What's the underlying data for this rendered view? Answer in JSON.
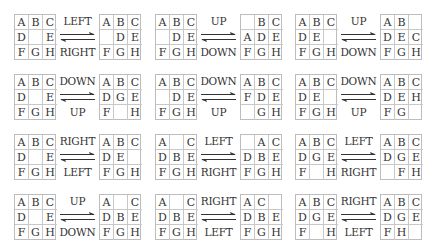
{
  "colors": {
    "text": "#333333",
    "grid_border": "#bdbdbd",
    "arrow": "#333333",
    "background": "#ffffff"
  },
  "transitions": [
    {
      "forward": "LEFT",
      "backward": "RIGHT",
      "from": [
        [
          "A",
          "B",
          "C"
        ],
        [
          "D",
          "",
          "E"
        ],
        [
          "F",
          "G",
          "H"
        ]
      ],
      "to": [
        [
          "A",
          "B",
          "C"
        ],
        [
          "",
          "D",
          "E"
        ],
        [
          "F",
          "G",
          "H"
        ]
      ]
    },
    {
      "forward": "UP",
      "backward": "DOWN",
      "from": [
        [
          "A",
          "B",
          "C"
        ],
        [
          "",
          "D",
          "E"
        ],
        [
          "F",
          "G",
          "H"
        ]
      ],
      "to": [
        [
          "",
          "B",
          "C"
        ],
        [
          "A",
          "D",
          "E"
        ],
        [
          "F",
          "G",
          "H"
        ]
      ]
    },
    {
      "forward": "UP",
      "backward": "DOWN",
      "from": [
        [
          "A",
          "B",
          "C"
        ],
        [
          "D",
          "E",
          ""
        ],
        [
          "F",
          "G",
          "H"
        ]
      ],
      "to": [
        [
          "A",
          "B",
          ""
        ],
        [
          "D",
          "E",
          "C"
        ],
        [
          "F",
          "G",
          "H"
        ]
      ]
    },
    {
      "forward": "DOWN",
      "backward": "UP",
      "from": [
        [
          "A",
          "B",
          "C"
        ],
        [
          "D",
          "",
          "E"
        ],
        [
          "F",
          "G",
          "H"
        ]
      ],
      "to": [
        [
          "A",
          "B",
          "C"
        ],
        [
          "D",
          "G",
          "E"
        ],
        [
          "F",
          "",
          "H"
        ]
      ]
    },
    {
      "forward": "DOWN",
      "backward": "UP",
      "from": [
        [
          "A",
          "B",
          "C"
        ],
        [
          "",
          "D",
          "E"
        ],
        [
          "F",
          "G",
          "H"
        ]
      ],
      "to": [
        [
          "A",
          "B",
          "C"
        ],
        [
          "F",
          "D",
          "E"
        ],
        [
          "",
          "G",
          "H"
        ]
      ]
    },
    {
      "forward": "DOWN",
      "backward": "UP",
      "from": [
        [
          "A",
          "B",
          "C"
        ],
        [
          "D",
          "E",
          ""
        ],
        [
          "F",
          "G",
          "H"
        ]
      ],
      "to": [
        [
          "A",
          "B",
          "C"
        ],
        [
          "D",
          "E",
          "H"
        ],
        [
          "F",
          "G",
          ""
        ]
      ]
    },
    {
      "forward": "RIGHT",
      "backward": "LEFT",
      "from": [
        [
          "A",
          "B",
          "C"
        ],
        [
          "D",
          "",
          "E"
        ],
        [
          "F",
          "G",
          "H"
        ]
      ],
      "to": [
        [
          "A",
          "B",
          "C"
        ],
        [
          "D",
          "E",
          ""
        ],
        [
          "F",
          "G",
          "H"
        ]
      ]
    },
    {
      "forward": "LEFT",
      "backward": "RIGHT",
      "from": [
        [
          "A",
          "",
          "C"
        ],
        [
          "D",
          "B",
          "E"
        ],
        [
          "F",
          "G",
          "H"
        ]
      ],
      "to": [
        [
          "",
          "A",
          "C"
        ],
        [
          "D",
          "B",
          "E"
        ],
        [
          "F",
          "G",
          "H"
        ]
      ]
    },
    {
      "forward": "LEFT",
      "backward": "RIGHT",
      "from": [
        [
          "A",
          "B",
          "C"
        ],
        [
          "D",
          "G",
          "E"
        ],
        [
          "F",
          "",
          "H"
        ]
      ],
      "to": [
        [
          "A",
          "B",
          "C"
        ],
        [
          "D",
          "G",
          "E"
        ],
        [
          "",
          "F",
          "H"
        ]
      ]
    },
    {
      "forward": "UP",
      "backward": "DOWN",
      "from": [
        [
          "A",
          "B",
          "C"
        ],
        [
          "D",
          "",
          "E"
        ],
        [
          "F",
          "G",
          "H"
        ]
      ],
      "to": [
        [
          "A",
          "",
          "C"
        ],
        [
          "D",
          "B",
          "E"
        ],
        [
          "F",
          "G",
          "H"
        ]
      ]
    },
    {
      "forward": "RIGHT",
      "backward": "LEFT",
      "from": [
        [
          "A",
          "",
          "C"
        ],
        [
          "D",
          "B",
          "E"
        ],
        [
          "F",
          "G",
          "H"
        ]
      ],
      "to": [
        [
          "A",
          "C",
          ""
        ],
        [
          "D",
          "B",
          "E"
        ],
        [
          "F",
          "G",
          "H"
        ]
      ]
    },
    {
      "forward": "RIGHT",
      "backward": "LEFT",
      "from": [
        [
          "A",
          "B",
          "C"
        ],
        [
          "D",
          "G",
          "E"
        ],
        [
          "F",
          "",
          "H"
        ]
      ],
      "to": [
        [
          "A",
          "B",
          "C"
        ],
        [
          "D",
          "G",
          "E"
        ],
        [
          "F",
          "H",
          ""
        ]
      ]
    }
  ]
}
